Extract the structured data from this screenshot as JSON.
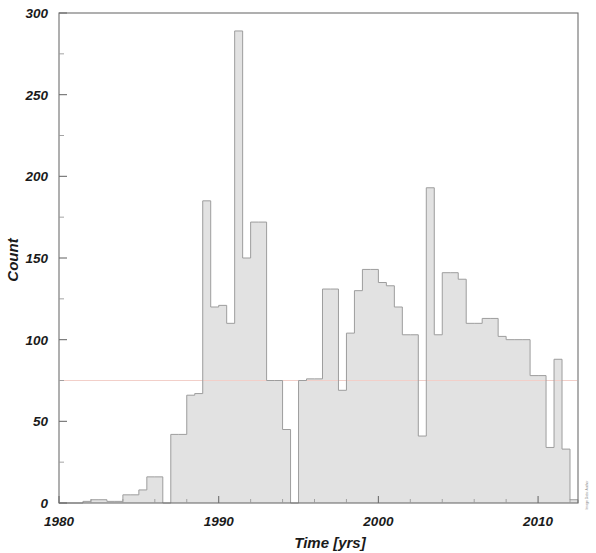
{
  "figure": {
    "kind": "histogram-figure",
    "background_color": "#ffffff",
    "frame_color": "#6e6e6e",
    "bar_fill_color": "#e2e2e2",
    "bar_edge_color": "#9d9d9d",
    "guide_line_color": "#f2cfc9",
    "credit_text": "Image Data: Author"
  },
  "axes": {
    "x_label": "Time [yrs]",
    "y_label": "Count",
    "x_ticks": [
      "1980",
      "1990",
      "2000",
      "2010"
    ],
    "y_ticks": [
      "0",
      "50",
      "100",
      "150",
      "200",
      "250",
      "300"
    ]
  },
  "chart_data": {
    "type": "bar",
    "title": "",
    "subtitle": "",
    "xlabel": "Time [yrs]",
    "ylabel": "Count",
    "xlim": [
      1980,
      2012.5
    ],
    "ylim": [
      0,
      300
    ],
    "x_tick_values": [
      1980,
      1990,
      2000,
      2010
    ],
    "x_minor_tick_step": 2,
    "y_tick_values": [
      0,
      50,
      100,
      150,
      200,
      250,
      300
    ],
    "y_minor_tick_step": 25,
    "grid": false,
    "legend": null,
    "bin_width": 0.5,
    "bin_unit": "years",
    "annotations": [
      {
        "kind": "horizontal-guide-line",
        "y": 75,
        "color": "#f2cfc9"
      }
    ],
    "categories": [
      "1980.0",
      "1980.5",
      "1981.0",
      "1981.5",
      "1982.0",
      "1982.5",
      "1983.0",
      "1983.5",
      "1984.0",
      "1984.5",
      "1985.0",
      "1985.5",
      "1986.0",
      "1986.5",
      "1987.0",
      "1987.5",
      "1988.0",
      "1988.5",
      "1989.0",
      "1989.5",
      "1990.0",
      "1990.5",
      "1991.0",
      "1991.5",
      "1992.0",
      "1992.5",
      "1993.0",
      "1993.5",
      "1994.0",
      "1994.5",
      "1995.0",
      "1995.5",
      "1996.0",
      "1996.5",
      "1997.0",
      "1997.5",
      "1998.0",
      "1998.5",
      "1999.0",
      "1999.5",
      "2000.0",
      "2000.5",
      "2001.0",
      "2001.5",
      "2002.0",
      "2002.5",
      "2003.0",
      "2003.5",
      "2004.0",
      "2004.5",
      "2005.0",
      "2005.5",
      "2006.0",
      "2006.5",
      "2007.0",
      "2007.5",
      "2008.0",
      "2008.5",
      "2009.0",
      "2009.5",
      "2010.0",
      "2010.5",
      "2011.0",
      "2011.5",
      "2012.0"
    ],
    "values": [
      0,
      0,
      0,
      1,
      2,
      2,
      1,
      1,
      5,
      5,
      8,
      16,
      16,
      0,
      42,
      42,
      66,
      67,
      185,
      120,
      121,
      110,
      289,
      150,
      172,
      172,
      75,
      75,
      45,
      0,
      75,
      76,
      76,
      131,
      131,
      69,
      104,
      130,
      143,
      143,
      135,
      133,
      120,
      103,
      103,
      41,
      193,
      103,
      141,
      141,
      137,
      110,
      110,
      113,
      113,
      102,
      100,
      100,
      100,
      78,
      78,
      34,
      88,
      33,
      2
    ],
    "notes": [
      "Half-year bins spanning 1980 through mid-2012.",
      "Tallest bin reaches 289 counts near 1991.",
      "A secondary spike of 193 counts occurs near 2003.",
      "A faint pink horizontal reference line is drawn at a count of 75."
    ]
  }
}
